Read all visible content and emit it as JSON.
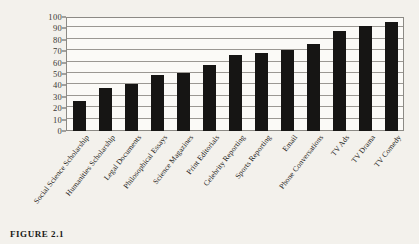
{
  "caption": "FIGURE 2.1",
  "chart_data": {
    "type": "bar",
    "title": "",
    "xlabel": "",
    "ylabel": "",
    "ylim": [
      0,
      100
    ],
    "ytick_step": 10,
    "grid": true,
    "legend": "none",
    "bar_color": "#161514",
    "categories": [
      "Social Science Scholarship",
      "Humanities Scholarship",
      "Legal Documents",
      "Philosophical Essays",
      "Science Magazines",
      "Print Editorials",
      "Celebrity Reporting",
      "Sports Reporting",
      "Email",
      "Phone Conversations",
      "TV Ads",
      "TV Drama",
      "TV Comedy"
    ],
    "values": [
      26,
      38,
      41,
      49,
      51,
      58,
      67,
      68,
      71,
      76,
      88,
      92,
      96
    ],
    "yticks": [
      "0",
      "10",
      "20",
      "30",
      "40",
      "50",
      "60",
      "70",
      "80",
      "90",
      "100"
    ]
  }
}
